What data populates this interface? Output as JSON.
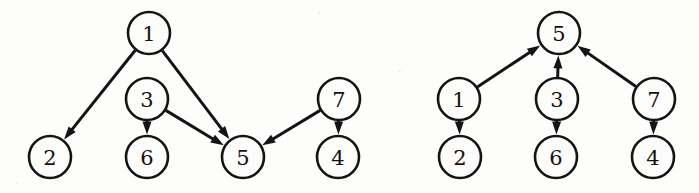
{
  "figure": {
    "background_color": "#fdfdfc",
    "ink_color": "#141414",
    "node_fill_color": "#fcfcfb",
    "node_radius": 21,
    "panel_count": 2
  },
  "chart_data": {
    "type": "diagram",
    "subtype": "directed-graph",
    "node_ids": [
      "1",
      "2",
      "3",
      "4",
      "5",
      "6",
      "7"
    ],
    "edges": [
      {
        "from": "1",
        "to": "2"
      },
      {
        "from": "1",
        "to": "5"
      },
      {
        "from": "3",
        "to": "6"
      },
      {
        "from": "3",
        "to": "5"
      },
      {
        "from": "7",
        "to": "5"
      },
      {
        "from": "7",
        "to": "4"
      }
    ],
    "panels": [
      {
        "name": "left-graph",
        "layout": "arbitrary",
        "nodes": [
          {
            "id": "1",
            "label": "1",
            "x": 149,
            "y": 33
          },
          {
            "id": "3",
            "label": "3",
            "x": 147,
            "y": 99
          },
          {
            "id": "7",
            "label": "7",
            "x": 339,
            "y": 99
          },
          {
            "id": "2",
            "label": "2",
            "x": 50,
            "y": 157
          },
          {
            "id": "6",
            "label": "6",
            "x": 147,
            "y": 157
          },
          {
            "id": "5",
            "label": "5",
            "x": 243,
            "y": 157
          },
          {
            "id": "4",
            "label": "4",
            "x": 338,
            "y": 157
          }
        ],
        "edges": [
          {
            "from": "1",
            "to": "2"
          },
          {
            "from": "1",
            "to": "5"
          },
          {
            "from": "3",
            "to": "6"
          },
          {
            "from": "3",
            "to": "5"
          },
          {
            "from": "7",
            "to": "5"
          },
          {
            "from": "7",
            "to": "4"
          }
        ]
      },
      {
        "name": "right-graph",
        "layout": "hierarchical",
        "nodes": [
          {
            "id": "5",
            "label": "5",
            "x": 559,
            "y": 33
          },
          {
            "id": "1",
            "label": "1",
            "x": 459,
            "y": 99
          },
          {
            "id": "3",
            "label": "3",
            "x": 557,
            "y": 99
          },
          {
            "id": "7",
            "label": "7",
            "x": 654,
            "y": 99
          },
          {
            "id": "2",
            "label": "2",
            "x": 460,
            "y": 157
          },
          {
            "id": "6",
            "label": "6",
            "x": 556,
            "y": 157
          },
          {
            "id": "4",
            "label": "4",
            "x": 653,
            "y": 157
          }
        ],
        "edges": [
          {
            "from": "1",
            "to": "5"
          },
          {
            "from": "1",
            "to": "2"
          },
          {
            "from": "3",
            "to": "5"
          },
          {
            "from": "3",
            "to": "6"
          },
          {
            "from": "7",
            "to": "5"
          },
          {
            "from": "7",
            "to": "4"
          }
        ]
      }
    ]
  }
}
